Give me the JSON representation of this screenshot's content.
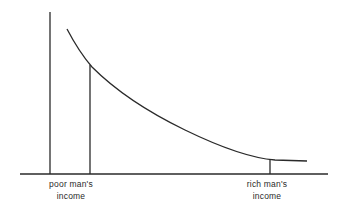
{
  "diagram": {
    "type": "marginal-utility-of-income-curve",
    "colors": {
      "stroke": "#2a2a2a",
      "background": "#ffffff"
    },
    "labels": {
      "poor": {
        "line1": "poor man's",
        "line2": "income"
      },
      "rich": {
        "line1": "rich man's",
        "line2": "income"
      }
    },
    "axes": {
      "y_axis": {
        "x": 50,
        "y_top": 12,
        "y_bottom": 174
      },
      "x_axis": {
        "y": 174,
        "x_left": 20,
        "x_right": 328
      }
    },
    "curve_points": [
      [
        67,
        29
      ],
      [
        90,
        65
      ],
      [
        130,
        93
      ],
      [
        180,
        127
      ],
      [
        225,
        147
      ],
      [
        270,
        160
      ],
      [
        307,
        161
      ]
    ],
    "markers": [
      {
        "name": "poor",
        "x": 90,
        "y_top": 65
      },
      {
        "name": "rich",
        "x": 270,
        "y_top": 160
      }
    ]
  }
}
